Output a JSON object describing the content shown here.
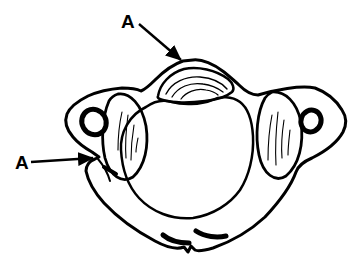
{
  "figure": {
    "labels": {
      "top": "A",
      "left": "A"
    },
    "colors": {
      "ink": "#000000",
      "background": "#ffffff"
    }
  }
}
